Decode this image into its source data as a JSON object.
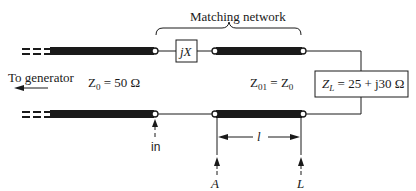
{
  "diagram": {
    "title_fragment": "",
    "matching_network_label": "Matching network",
    "to_generator_label": "To generator",
    "z0_label": {
      "symbol": "Z",
      "sub": "0",
      "rest": " = 50 Ω"
    },
    "z01_label": {
      "symbol": "Z",
      "sub": "01",
      "eq": " = Z",
      "sub2": "0"
    },
    "zl_label": {
      "symbol": "Z",
      "sub": "L",
      "rest": " = 25 + j30 Ω"
    },
    "jx_label": "jX",
    "in_label": "in",
    "length_label": "l",
    "point_a_label": "A",
    "point_l_label": "L",
    "colors": {
      "line": "#1a1a1a",
      "background": "#ffffff"
    }
  }
}
